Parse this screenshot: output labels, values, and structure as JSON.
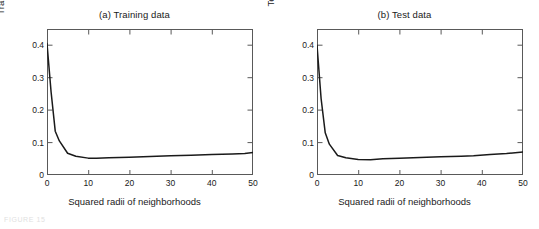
{
  "figure": {
    "background_color": "#ffffff",
    "axis_color": "#595959",
    "line_color": "#1a1a1a",
    "caption_fragment": "FIGURE 15"
  },
  "axis": {
    "xticks": [
      "0",
      "10",
      "20",
      "30",
      "40",
      "50"
    ],
    "yticks": [
      "0",
      "0.1",
      "0.2",
      "0.3",
      "0.4"
    ],
    "xlabel": "Squared radii of neighborhoods"
  },
  "panels": [
    {
      "title": "(a) Training data",
      "ylabel": "Training errors"
    },
    {
      "title": "(b) Test data",
      "ylabel": "Test errors"
    }
  ],
  "chart_data": [
    {
      "type": "line",
      "title": "(a) Training data",
      "xlabel": "Squared radii of neighborhoods",
      "ylabel": "Training errors",
      "xlim": [
        0,
        50
      ],
      "ylim": [
        0,
        0.45
      ],
      "xticks": [
        0,
        10,
        20,
        30,
        40,
        50
      ],
      "yticks": [
        0,
        0.1,
        0.2,
        0.3,
        0.4
      ],
      "grid": false,
      "legend": null,
      "series": [
        {
          "name": "Training errors",
          "x": [
            0,
            1,
            2,
            3,
            5,
            7,
            10,
            12,
            15,
            20,
            25,
            30,
            35,
            40,
            45,
            48,
            50
          ],
          "values": [
            0.405,
            0.255,
            0.135,
            0.105,
            0.067,
            0.058,
            0.052,
            0.052,
            0.053,
            0.055,
            0.057,
            0.059,
            0.061,
            0.063,
            0.065,
            0.066,
            0.069
          ]
        }
      ]
    },
    {
      "type": "line",
      "title": "(b) Test data",
      "xlabel": "Squared radii of neighborhoods",
      "ylabel": "Test errors",
      "xlim": [
        0,
        50
      ],
      "ylim": [
        0,
        0.45
      ],
      "xticks": [
        0,
        10,
        20,
        30,
        40,
        50
      ],
      "yticks": [
        0,
        0.1,
        0.2,
        0.3,
        0.4
      ],
      "grid": false,
      "legend": null,
      "series": [
        {
          "name": "Test errors",
          "x": [
            0,
            1,
            2,
            3,
            5,
            7,
            10,
            13,
            16,
            20,
            25,
            30,
            35,
            38,
            42,
            46,
            50
          ],
          "values": [
            0.4,
            0.235,
            0.13,
            0.095,
            0.06,
            0.053,
            0.048,
            0.047,
            0.05,
            0.052,
            0.054,
            0.056,
            0.058,
            0.059,
            0.063,
            0.066,
            0.071
          ]
        }
      ]
    }
  ]
}
